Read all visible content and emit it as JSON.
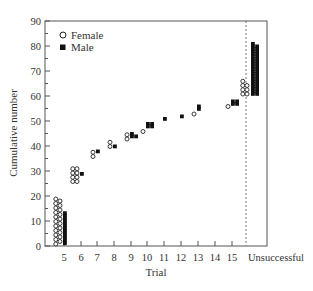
{
  "chart_data": {
    "type": "scatter",
    "title": "",
    "xlabel": "Trial",
    "ylabel": "Cumulative number",
    "ylim": [
      0,
      90
    ],
    "yticks": [
      0,
      10,
      20,
      30,
      40,
      50,
      60,
      70,
      80,
      90
    ],
    "categories": [
      "5",
      "6",
      "7",
      "8",
      "9",
      "10",
      "11",
      "12",
      "13",
      "14",
      "15",
      "Unsuccessful"
    ],
    "grid": false,
    "legend": {
      "position": "top-left",
      "entries": [
        "Female",
        "Male"
      ]
    },
    "reference_line": {
      "type": "vertical-dashed",
      "between": [
        "15",
        "Unsuccessful"
      ]
    },
    "series": [
      {
        "name": "Female",
        "marker": "open-circle",
        "counts": [
          21,
          8,
          2,
          2,
          2,
          1,
          0,
          0,
          1,
          0,
          1,
          7
        ],
        "cumulative_end": [
          21,
          33,
          37,
          41,
          44,
          46,
          46,
          46,
          53,
          53,
          56,
          67
        ]
      },
      {
        "name": "Male",
        "marker": "filled-square",
        "counts": [
          13,
          1,
          1,
          1,
          3,
          4,
          1,
          1,
          2,
          0,
          4,
          41
        ],
        "cumulative_end": [
          13,
          29,
          38,
          40,
          45,
          49,
          51,
          52,
          56,
          56,
          58,
          81
        ]
      }
    ]
  }
}
